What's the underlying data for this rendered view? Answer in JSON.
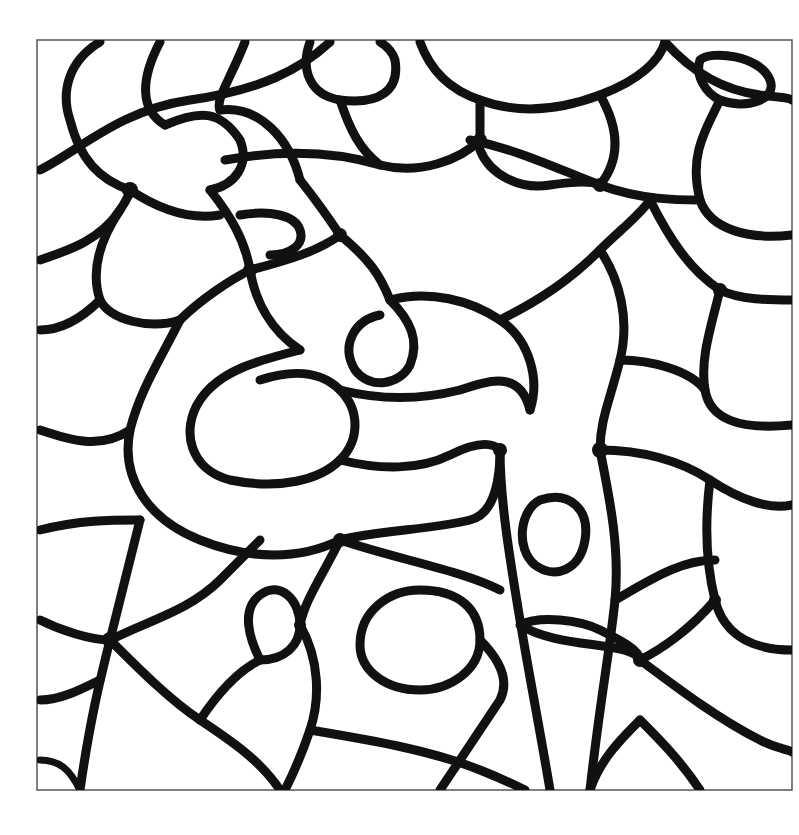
{
  "artwork": {
    "kind": "abstract line-art coloring page",
    "palette": {
      "lines": "#111111",
      "background": "#ffffff",
      "frame": "#555555"
    },
    "frame": {
      "x": 37,
      "y": 40,
      "width": 755,
      "height": 750
    }
  }
}
